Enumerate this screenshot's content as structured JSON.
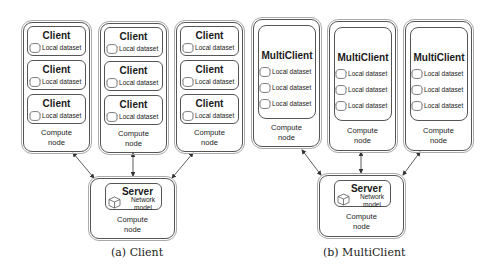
{
  "panels": [
    {
      "id": "a",
      "caption": "(a) Client",
      "compute_nodes": [
        {
          "label": "Compute node",
          "clients": [
            {
              "title": "Client",
              "dataset": "Local dataset"
            },
            {
              "title": "Client",
              "dataset": "Local dataset"
            },
            {
              "title": "Client",
              "dataset": "Local dataset"
            }
          ]
        },
        {
          "label": "Compute node",
          "clients": [
            {
              "title": "Client",
              "dataset": "Local dataset"
            },
            {
              "title": "Client",
              "dataset": "Local dataset"
            },
            {
              "title": "Client",
              "dataset": "Local dataset"
            }
          ]
        },
        {
          "label": "Compute node",
          "clients": [
            {
              "title": "Client",
              "dataset": "Local dataset"
            },
            {
              "title": "Client",
              "dataset": "Local dataset"
            },
            {
              "title": "Client",
              "dataset": "Local dataset"
            }
          ]
        }
      ],
      "server": {
        "title": "Server",
        "model_line1": "Network",
        "model_line2": "model",
        "label": "Compute node"
      }
    },
    {
      "id": "b",
      "caption": "(b) MultiClient",
      "compute_nodes": [
        {
          "label": "Compute node",
          "multiclient": {
            "title": "MultiClient",
            "datasets": [
              "Local dataset",
              "Local dataset",
              "Local dataset"
            ]
          }
        },
        {
          "label": "Compute node",
          "multiclient": {
            "title": "MultiClient",
            "datasets": [
              "Local dataset",
              "Local dataset",
              "Local dataset"
            ]
          }
        },
        {
          "label": "Compute node",
          "multiclient": {
            "title": "MultiClient",
            "datasets": [
              "Local dataset",
              "Local dataset",
              "Local dataset"
            ]
          }
        }
      ],
      "server": {
        "title": "Server",
        "model_line1": "Network",
        "model_line2": "model",
        "label": "Compute node"
      }
    }
  ],
  "labels": {
    "compute_line1": "Compute",
    "compute_line2": "node"
  },
  "icons": {
    "dataset": "database-cylinder-icon",
    "model": "cube-icon"
  },
  "colors": {
    "stroke": "#555555",
    "outer_stroke": "#aaaaaa",
    "text": "#1a1a1a"
  }
}
